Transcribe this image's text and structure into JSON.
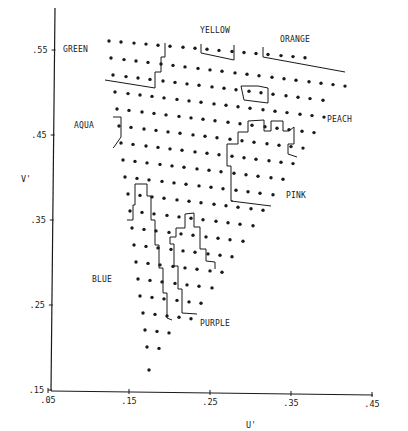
{
  "chart_data": {
    "type": "scatter",
    "title": "",
    "xlabel": "U'",
    "ylabel": "V'",
    "xlim": [
      0.05,
      0.45
    ],
    "ylim": [
      0.15,
      0.55
    ],
    "grid": false,
    "x_ticks": [
      ".05",
      ".15",
      ".25",
      ".35",
      ".45"
    ],
    "y_ticks": [
      ".15",
      ".25",
      ".35",
      ".45",
      ".55"
    ],
    "region_labels": [
      {
        "name": "GREEN",
        "u": 0.068,
        "v": 0.553
      },
      {
        "name": "YELLOW",
        "u": 0.24,
        "v": 0.588
      },
      {
        "name": "ORANGE",
        "u": 0.308,
        "v": 0.567
      },
      {
        "name": "AQUA",
        "u": 0.085,
        "v": 0.462
      },
      {
        "name": "PEACH",
        "u": 0.385,
        "v": 0.471
      },
      {
        "name": "PINK",
        "u": 0.339,
        "v": 0.371
      },
      {
        "name": "BLUE",
        "u": 0.096,
        "v": 0.282
      },
      {
        "name": "PURPLE",
        "u": 0.243,
        "v": 0.225
      }
    ],
    "points_px": {
      "rows": [
        {
          "y0": 41,
          "dy": 0.085,
          "xs": [
            109,
            121,
            134,
            146,
            158,
            170,
            183,
            195,
            207,
            219,
            232,
            244,
            256,
            268,
            281,
            293,
            305
          ]
        },
        {
          "y0": 58,
          "dy": 0.12,
          "xs": [
            111,
            124,
            136,
            148,
            161,
            173,
            185,
            198,
            210,
            222,
            235,
            247,
            259,
            272,
            284,
            296,
            309,
            321,
            333,
            345
          ]
        },
        {
          "y0": 75,
          "dy": 0.12,
          "xs": [
            113,
            126,
            138,
            150,
            163,
            175,
            187,
            199,
            212,
            224,
            236,
            249,
            261,
            273,
            286,
            298,
            310,
            323
          ]
        },
        {
          "y0": 92,
          "dy": 0.12,
          "xs": [
            115,
            128,
            140,
            152,
            164,
            177,
            189,
            201,
            214,
            226,
            238,
            250,
            263,
            275,
            287,
            300,
            312,
            324
          ]
        },
        {
          "y0": 109,
          "dy": 0.12,
          "xs": [
            117,
            129,
            142,
            154,
            166,
            179,
            191,
            203,
            215,
            228,
            240,
            252,
            265,
            277,
            289,
            302,
            314
          ]
        },
        {
          "y0": 126,
          "dy": 0.12,
          "xs": [
            119,
            131,
            144,
            156,
            168,
            180,
            193,
            205,
            217,
            230,
            242,
            254,
            267,
            279,
            291,
            303
          ]
        },
        {
          "y0": 143,
          "dy": 0.12,
          "xs": [
            121,
            133,
            146,
            158,
            170,
            182,
            195,
            207,
            219,
            232,
            244,
            256,
            269,
            281,
            293
          ]
        },
        {
          "y0": 160,
          "dy": 0.12,
          "xs": [
            123,
            135,
            147,
            160,
            172,
            184,
            197,
            209,
            221,
            234,
            246,
            258,
            271,
            283
          ]
        },
        {
          "y0": 177,
          "dy": 0.12,
          "xs": [
            125,
            137,
            149,
            162,
            174,
            186,
            199,
            211,
            223,
            236,
            248,
            260,
            273
          ]
        },
        {
          "y0": 194,
          "dy": 0.12,
          "xs": [
            128,
            140,
            152,
            164,
            177,
            189,
            201,
            214,
            226,
            238,
            251,
            263
          ]
        },
        {
          "y0": 211,
          "dy": 0.12,
          "xs": [
            130,
            142,
            154,
            167,
            179,
            191,
            203,
            216,
            228,
            240,
            253
          ]
        },
        {
          "y0": 228,
          "dy": 0.12,
          "xs": [
            132,
            144,
            156,
            169,
            181,
            193,
            206,
            218,
            230,
            243
          ]
        },
        {
          "y0": 245,
          "dy": 0.12,
          "xs": [
            134,
            146,
            158,
            171,
            183,
            195,
            208,
            220,
            232
          ]
        },
        {
          "y0": 262,
          "dy": 0.12,
          "xs": [
            136,
            148,
            160,
            173,
            185,
            197,
            210,
            222
          ]
        },
        {
          "y0": 279,
          "dy": 0.12,
          "xs": [
            138,
            150,
            162,
            175,
            187,
            199,
            212
          ]
        },
        {
          "y0": 296,
          "dy": 0.12,
          "xs": [
            140,
            152,
            164,
            177,
            189,
            201
          ]
        },
        {
          "y0": 313,
          "dy": 0.12,
          "xs": [
            143,
            155,
            167,
            179,
            191
          ]
        },
        {
          "y0": 330,
          "dy": 0.12,
          "xs": [
            145,
            157,
            169
          ]
        },
        {
          "y0": 347,
          "dy": 0.12,
          "xs": [
            147,
            159
          ]
        },
        {
          "y0": 370,
          "dy": 0,
          "xs": [
            149
          ]
        }
      ]
    },
    "boundaries_px": [
      "M 105,80 L 155,88 L 155,72 L 161,72 L 161,57 L 165,57 L 165,43",
      "M 201,44 L 201,53 L 234,60 L 234,45",
      "M 263,47 L 263,57 L 345,72",
      "M 241,86 L 258,86 L 268,88 L 268,103 L 244,100 Z",
      "M 113,117 L 121,117 L 121,137 L 114,147 L 113,148",
      "M 227,166 L 227,144 L 238,144 L 238,132 L 248,132 L 248,121 L 264,120 L 264,131 L 271,131 L 271,121 L 283,121 L 283,131 L 289,131 L 294,127 L 294,144 L 288,144 L 288,154 L 297,157",
      "M 233,201 L 231,201 L 231,166 L 227,166",
      "M 231,201 L 271,206",
      "M 135,184 L 147,184 L 147,196 L 151,196 L 151,220 L 155,220 L 155,245 L 159,245 L 159,268 L 163,268 L 163,293 L 167,293 L 167,318 L 172,320",
      "M 127,220 L 133,220 L 133,205 L 135,205 L 135,184",
      "M 197,314 L 182,313 L 182,289 L 178,289 L 178,266 L 174,266 L 174,244 L 170,244 L 170,237 L 176,237 L 176,228 L 185,228 L 185,214 L 194,213 L 194,227 L 200,227 L 200,249 L 206,249 L 206,261 L 215,262 L 215,269"
    ]
  },
  "axes": {
    "x_label": "U'",
    "y_label": "V'",
    "x_ticks": [
      {
        "label": ".05",
        "x": 48
      },
      {
        "label": ".15",
        "x": 129
      },
      {
        "label": ".25",
        "x": 210
      },
      {
        "label": ".35",
        "x": 291
      },
      {
        "label": ".45",
        "x": 372
      }
    ],
    "y_ticks": [
      {
        "label": ".55",
        "y": 50
      },
      {
        "label": ".45",
        "y": 135
      },
      {
        "label": ".35",
        "y": 220
      },
      {
        "label": ".25",
        "y": 305
      },
      {
        "label": ".15",
        "y": 390
      }
    ]
  },
  "labels": {
    "green": "GREEN",
    "yellow": "YELLOW",
    "orange": "ORANGE",
    "aqua": "AQUA",
    "peach": "PEACH",
    "pink": "PINK",
    "blue": "BLUE",
    "purple": "PURPLE"
  },
  "colors": {
    "ink": "#1a1a1a",
    "background": "#ffffff"
  }
}
